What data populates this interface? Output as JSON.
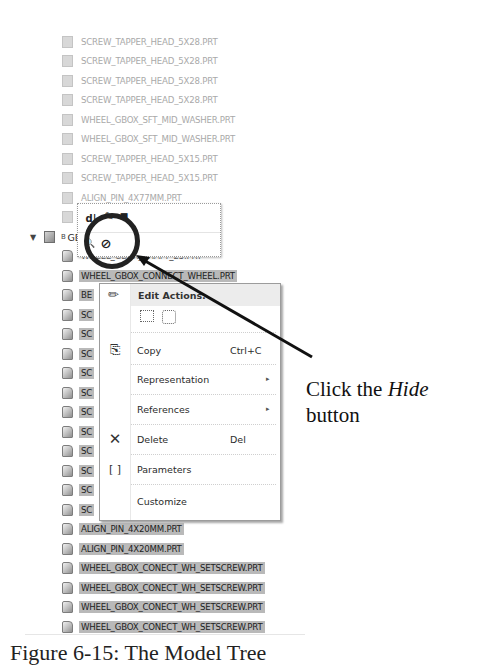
{
  "model_tree": {
    "faded_items": [
      {
        "label": "SCREW_TAPPER_HEAD_5X28.PRT"
      },
      {
        "label": "SCREW_TAPPER_HEAD_5X28.PRT"
      },
      {
        "label": "SCREW_TAPPER_HEAD_5X28.PRT"
      },
      {
        "label": "SCREW_TAPPER_HEAD_5X28.PRT"
      },
      {
        "label": "WHEEL_GBOX_SFT_MID_WASHER.PRT"
      },
      {
        "label": "WHEEL_GBOX_SFT_MID_WASHER.PRT"
      },
      {
        "label": "SCREW_TAPPER_HEAD_5X15.PRT"
      },
      {
        "label": "SCREW_TAPPER_HEAD_5X15.PRT"
      },
      {
        "label": "ALIGN_PIN_4X77MM.PRT"
      },
      {
        "label": "AL"
      }
    ],
    "assembly": {
      "label": "GBOX",
      "expander": "▼",
      "prefix": "B"
    },
    "child_items": [
      {
        "label": "WHEEL_GBOX_SHAFT_25.PRT",
        "selected": false
      },
      {
        "label": "WHEEL_GBOX_CONNECT_WHEEL.PRT",
        "selected": true
      },
      {
        "label": "BE",
        "selected": true
      },
      {
        "label": "SC",
        "selected": true
      },
      {
        "label": "SC",
        "selected": true
      },
      {
        "label": "SC",
        "selected": true
      },
      {
        "label": "SC",
        "selected": true
      },
      {
        "label": "SC",
        "selected": true
      },
      {
        "label": "SC",
        "selected": true
      },
      {
        "label": "SC",
        "selected": true
      },
      {
        "label": "SC",
        "selected": true
      },
      {
        "label": "SC",
        "selected": true
      },
      {
        "label": "SC",
        "selected": true
      },
      {
        "label": "SC",
        "selected": true
      },
      {
        "label": "ALIGN_PIN_4X20MM.PRT",
        "selected": true
      },
      {
        "label": "ALIGN_PIN_4X20MM.PRT",
        "selected": true
      },
      {
        "label": "WHEEL_GBOX_CONECT_WH_SETSCREW.PRT",
        "selected": true
      },
      {
        "label": "WHEEL_GBOX_CONECT_WH_SETSCREW.PRT",
        "selected": true
      },
      {
        "label": "WHEEL_GBOX_CONECT_WH_SETSCREW.PRT",
        "selected": true
      },
      {
        "label": "WHEEL_GBOX_CONECT_WH_SETSCREW.PRT",
        "selected": true
      }
    ]
  },
  "mini_toolbar": {
    "buttons": [
      {
        "name": "edit-dimensions",
        "glyph": "d|"
      },
      {
        "name": "edit-definition",
        "glyph": "✎"
      },
      {
        "name": "lock",
        "glyph": "■"
      },
      {
        "name": "zoom-to",
        "glyph": "🔍"
      },
      {
        "name": "hide",
        "glyph": "⊘"
      }
    ]
  },
  "context_menu": {
    "header": "Edit Actions:",
    "items": [
      {
        "label": "Copy",
        "shortcut": "Ctrl+C",
        "icon": "copy-icon",
        "submenu": false
      },
      {
        "label": "Representation",
        "shortcut": "",
        "icon": "",
        "submenu": true
      },
      {
        "label": "References",
        "shortcut": "",
        "icon": "",
        "submenu": true
      },
      {
        "label": "Delete",
        "shortcut": "Del",
        "icon": "delete-icon",
        "submenu": false
      },
      {
        "label": "Parameters",
        "shortcut": "",
        "icon": "parameters-icon",
        "submenu": false
      },
      {
        "label": "Customize",
        "shortcut": "",
        "icon": "",
        "submenu": false
      }
    ],
    "icons": {
      "edit": "✏",
      "delete": "✕",
      "parameters": "[ ]",
      "arrow": "▸"
    }
  },
  "callout": {
    "prefix": "Click the ",
    "emphasis": "Hide",
    "suffix": "button"
  },
  "caption": {
    "text": "Figure 6-15: The Model Tree"
  }
}
